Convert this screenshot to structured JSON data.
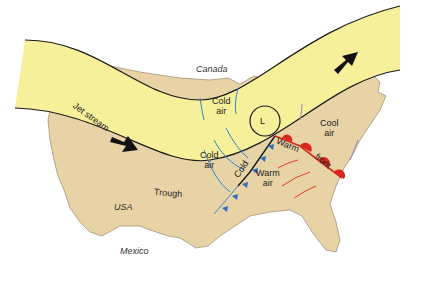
{
  "diagram": {
    "labels": {
      "canada": "Canada",
      "usa": "USA",
      "mexico": "Mexico",
      "jet_stream": "Jet stream",
      "trough": "Trough",
      "low": "L",
      "cold_air_1_line1": "Cold",
      "cold_air_1_line2": "air",
      "cold_air_2_line1": "Cold",
      "cold_air_2_line2": "air",
      "cold_front": "Cold",
      "warm_front_1": "Warm",
      "warm_front_2": "front",
      "warm_air_line1": "Warm",
      "warm_air_line2": "air",
      "cool_air_line1": "Cool",
      "cool_air_line2": "air"
    },
    "colors": {
      "land": "#e8d3a6",
      "jet_band": "#f6f09a",
      "cold_arrow": "#2e86c8",
      "warm_arrow": "#e0402a",
      "cool_arrow": "#9a86c6",
      "warm_front": "#d8281c",
      "cold_front": "#2e6ec0",
      "outline": "#1a1a1a"
    }
  }
}
